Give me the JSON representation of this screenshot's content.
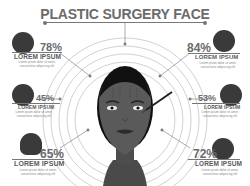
{
  "title": "PLASTIC SURGERY FACE",
  "colors": {
    "text": "#6b6b6b",
    "icon_bg": "#3a3a3a",
    "skin": "#555555",
    "hair": "#111111",
    "rings": "#bbbbbb"
  },
  "stats": [
    {
      "position": "top-left",
      "percent": "78%",
      "label": "LOREM IPSUM",
      "icon": "eye-icon",
      "desc": "Lorem ipsum dolor sit amet, consectetur adipiscing elit"
    },
    {
      "position": "middle-left",
      "percent": "45%",
      "label": "LOREM IPSUM",
      "icon": "cosmetic-jar-icon",
      "desc": "Lorem ipsum dolor sit amet, consectetur adipiscing elit"
    },
    {
      "position": "bottom-left",
      "percent": "65%",
      "label": "LOREM IPSUM",
      "icon": "face-portrait-icon",
      "desc": "Lorem ipsum dolor sit amet, consectetur adipiscing elit"
    },
    {
      "position": "top-right",
      "percent": "84%",
      "label": "LOREM IPSUM",
      "icon": "lips-icon",
      "desc": "Lorem ipsum dolor sit amet, consectetur adipiscing elit"
    },
    {
      "position": "middle-right",
      "percent": "53%",
      "label": "LOREM IPSUM",
      "icon": "cosmetic-bottle-icon",
      "desc": "Lorem ipsum dolor sit amet, consectetur adipiscing elit"
    },
    {
      "position": "bottom-right",
      "percent": "72%",
      "label": "LOREM IPSUM",
      "icon": "nose-icon",
      "desc": "Lorem ipsum dolor sit amet, consectetur adipiscing elit"
    }
  ]
}
